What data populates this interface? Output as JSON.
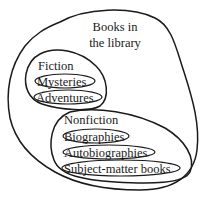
{
  "diagram": {
    "type": "nested-set (Euler) diagram",
    "outer_set": {
      "label_line1": "Books in",
      "label_line2": "the library"
    },
    "subsets": [
      {
        "label": "Fiction",
        "items": [
          "Mysteries",
          "Adventures"
        ]
      },
      {
        "label": "Nonfiction",
        "items": [
          "Biographies",
          "Autobiographies",
          "Subject-matter books"
        ]
      }
    ],
    "colors": {
      "stroke": "#1a1a1a",
      "text": "#1a1a1a",
      "background": "#ffffff"
    }
  }
}
